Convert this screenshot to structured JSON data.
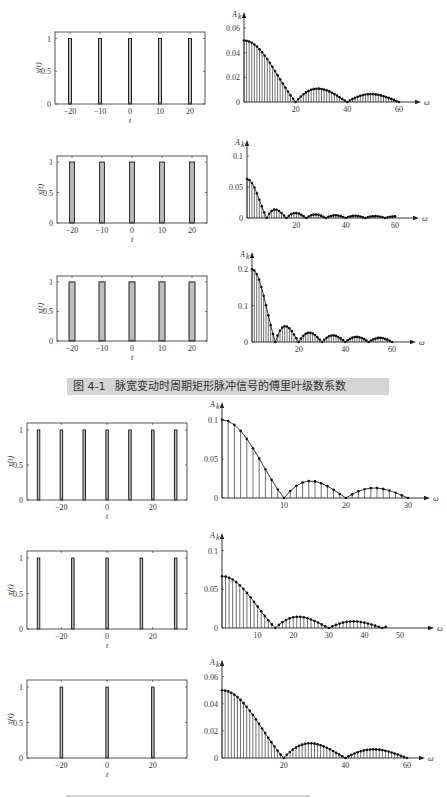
{
  "figure": {
    "caption_number": "图 4-1",
    "caption_text": "脉宽变动时周期矩形脉冲信号的傅里叶级数系数"
  },
  "chart_data": [
    {
      "id": "row1-time",
      "type": "bar",
      "title": "",
      "xlabel": "t",
      "ylabel": "x(t)",
      "xlim": [
        -25,
        25
      ],
      "ylim": [
        0,
        1.1
      ],
      "xticks": [
        -20,
        -10,
        0,
        10,
        20
      ],
      "yticks": [
        0,
        0.5,
        1
      ],
      "period": 10,
      "pulse_width": 1,
      "pulse_centers": [
        -20,
        -10,
        0,
        10,
        20
      ],
      "amplitude": 1,
      "grid": false
    },
    {
      "id": "row1-spectrum",
      "type": "stem",
      "xlabel": "ω",
      "ylabel": "A_k",
      "xlim": [
        0,
        60
      ],
      "ylim": [
        0,
        0.065
      ],
      "xticks": [
        20,
        40,
        60
      ],
      "yticks": [
        0,
        0.02,
        0.04,
        0.06
      ],
      "peak": 0.05,
      "zeros_at": [
        20,
        40,
        60
      ],
      "step": 1,
      "side_lobes": [
        {
          "center": 29,
          "height": 0.011
        },
        {
          "center": 49,
          "height": 0.0065
        }
      ]
    },
    {
      "id": "row2-time",
      "type": "bar",
      "xlabel": "t",
      "ylabel": "x(t)",
      "xlim": [
        -25,
        25
      ],
      "ylim": [
        0,
        1.1
      ],
      "xticks": [
        -20,
        -10,
        0,
        10,
        20
      ],
      "yticks": [
        0,
        0.5,
        1
      ],
      "period": 10,
      "pulse_width": 1.6,
      "pulse_centers": [
        -20,
        -10,
        0,
        10,
        20
      ],
      "amplitude": 1
    },
    {
      "id": "row2-spectrum",
      "type": "stem",
      "xlabel": "ω",
      "ylabel": "A_k",
      "xlim": [
        0,
        60
      ],
      "ylim": [
        0,
        0.11
      ],
      "xticks": [
        20,
        40,
        60
      ],
      "yticks": [
        0,
        0.05,
        0.1
      ],
      "peak": 0.063,
      "zeros_at": [
        8,
        16,
        24,
        32,
        40,
        48,
        56
      ],
      "step": 1,
      "side_lobes": [
        {
          "center": 12,
          "height": 0.013
        },
        {
          "center": 20,
          "height": 0.008
        },
        {
          "center": 28,
          "height": 0.0055
        },
        {
          "center": 36,
          "height": 0.0045
        },
        {
          "center": 44,
          "height": 0.004
        },
        {
          "center": 52,
          "height": 0.0035
        },
        {
          "center": 59,
          "height": 0.003
        }
      ]
    },
    {
      "id": "row3-time",
      "type": "bar",
      "xlabel": "t",
      "ylabel": "x(t)",
      "xlim": [
        -25,
        25
      ],
      "ylim": [
        0,
        1.1
      ],
      "xticks": [
        -20,
        -10,
        0,
        10,
        20
      ],
      "yticks": [
        0,
        0.5,
        1
      ],
      "period": 10,
      "pulse_width": 2,
      "pulse_centers": [
        -20,
        -10,
        0,
        10,
        20
      ],
      "amplitude": 1
    },
    {
      "id": "row3-spectrum",
      "type": "stem",
      "xlabel": "ω",
      "ylabel": "A_k",
      "xlim": [
        0,
        60
      ],
      "ylim": [
        0,
        0.22
      ],
      "xticks": [
        20,
        40,
        60
      ],
      "yticks": [
        0,
        0.1,
        0.2
      ],
      "peak": 0.2,
      "zeros_at": [
        10,
        20,
        30,
        40,
        50,
        60
      ],
      "step": 1,
      "side_lobes": [
        {
          "center": 15,
          "height": 0.045
        },
        {
          "center": 25,
          "height": 0.028
        },
        {
          "center": 35,
          "height": 0.021
        },
        {
          "center": 45,
          "height": 0.017
        },
        {
          "center": 55,
          "height": 0.015
        }
      ]
    },
    {
      "id": "row4-time",
      "type": "bar",
      "xlabel": "t",
      "ylabel": "x(t)",
      "xlim": [
        -35,
        35
      ],
      "ylim": [
        0,
        1.1
      ],
      "xticks": [
        -20,
        0,
        20
      ],
      "yticks": [
        0,
        0.5,
        1
      ],
      "period": 10,
      "pulse_width": 1,
      "pulse_centers": [
        -30,
        -20,
        -10,
        0,
        10,
        20,
        30
      ],
      "amplitude": 1
    },
    {
      "id": "row4-spectrum",
      "type": "stem",
      "xlabel": "ω",
      "ylabel": "A_k",
      "xlim": [
        0,
        30
      ],
      "ylim": [
        0,
        0.11
      ],
      "xticks": [
        10,
        20,
        30
      ],
      "yticks": [
        0,
        0.05,
        0.1
      ],
      "peak": 0.1,
      "zeros_at": [
        10,
        20,
        30
      ],
      "step": 1,
      "side_lobes": [
        {
          "center": 15,
          "height": 0.022
        },
        {
          "center": 25,
          "height": 0.013
        }
      ]
    },
    {
      "id": "row5-time",
      "type": "bar",
      "xlabel": "t",
      "ylabel": "x(t)",
      "xlim": [
        -35,
        35
      ],
      "ylim": [
        0,
        1.1
      ],
      "xticks": [
        -20,
        0,
        20
      ],
      "yticks": [
        0,
        0.5,
        1
      ],
      "period": 15,
      "pulse_width": 1,
      "pulse_centers": [
        -30,
        -15,
        0,
        15,
        30
      ],
      "amplitude": 1
    },
    {
      "id": "row5-spectrum",
      "type": "stem",
      "xlabel": "ω",
      "ylabel": "A_k",
      "xlim": [
        0,
        50
      ],
      "ylim": [
        0,
        0.11
      ],
      "xticks": [
        10,
        20,
        30,
        40,
        50
      ],
      "yticks": [
        0,
        0.05,
        0.1
      ],
      "peak": 0.067,
      "zeros_at": [
        15,
        30,
        45
      ],
      "step": 1,
      "side_lobes": [
        {
          "center": 22,
          "height": 0.015
        },
        {
          "center": 38,
          "height": 0.009
        }
      ]
    },
    {
      "id": "row6-time",
      "type": "bar",
      "xlabel": "t",
      "ylabel": "x(t)",
      "xlim": [
        -35,
        35
      ],
      "ylim": [
        0,
        1.1
      ],
      "xticks": [
        -20,
        0,
        20
      ],
      "yticks": [
        0,
        0.5,
        1
      ],
      "period": 20,
      "pulse_width": 1,
      "pulse_centers": [
        -20,
        0,
        20
      ],
      "amplitude": 1
    },
    {
      "id": "row6-spectrum",
      "type": "stem",
      "xlabel": "ω",
      "ylabel": "A_k",
      "xlim": [
        0,
        60
      ],
      "ylim": [
        0,
        0.065
      ],
      "xticks": [
        20,
        40,
        60
      ],
      "yticks": [
        0,
        0.02,
        0.04,
        0.06
      ],
      "peak": 0.05,
      "zeros_at": [
        20,
        40,
        60
      ],
      "step": 1,
      "side_lobes": [
        {
          "center": 29,
          "height": 0.011
        },
        {
          "center": 49,
          "height": 0.0065
        }
      ]
    }
  ],
  "layout": {
    "time_panels": [
      {
        "left": 55,
        "top": 32,
        "width": 150,
        "height": 72,
        "label_tick_skip": false
      },
      {
        "left": 57,
        "top": 156,
        "width": 150,
        "height": 67
      },
      {
        "left": 57,
        "top": 276,
        "width": 150,
        "height": 65
      },
      {
        "left": 27,
        "top": 423,
        "width": 160,
        "height": 77
      },
      {
        "left": 27,
        "top": 551,
        "width": 160,
        "height": 78
      },
      {
        "left": 27,
        "top": 680,
        "width": 160,
        "height": 78
      }
    ],
    "spectrum_panels": [
      {
        "left": 244,
        "top": 22,
        "width": 155,
        "height": 80,
        "axis_extra": 16
      },
      {
        "left": 247,
        "top": 150,
        "width": 148,
        "height": 68,
        "axis_extra": 18
      },
      {
        "left": 252,
        "top": 262,
        "width": 140,
        "height": 80,
        "axis_extra": 18
      },
      {
        "left": 222,
        "top": 412,
        "width": 186,
        "height": 86,
        "axis_extra": 16
      },
      {
        "left": 222,
        "top": 543,
        "width": 178,
        "height": 85,
        "axis_extra": 28
      },
      {
        "left": 222,
        "top": 670,
        "width": 185,
        "height": 88,
        "axis_extra": 12
      }
    ]
  }
}
